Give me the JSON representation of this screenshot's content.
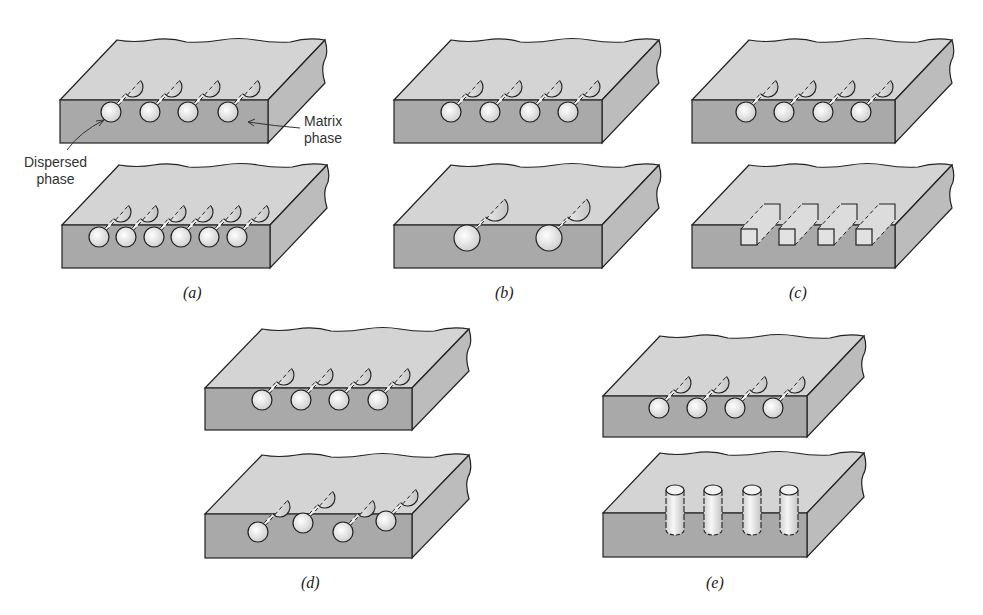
{
  "figure": {
    "panels": [
      {
        "id": "a",
        "label": "(a)",
        "description": "Concentration",
        "top": {
          "fibers": 4,
          "shape": "round"
        },
        "bottom": {
          "fibers": 6,
          "shape": "round"
        }
      },
      {
        "id": "b",
        "label": "(b)",
        "description": "Size",
        "top": {
          "fibers": 4,
          "shape": "round"
        },
        "bottom": {
          "fibers": 2,
          "shape": "round-large"
        }
      },
      {
        "id": "c",
        "label": "(c)",
        "description": "Shape",
        "top": {
          "fibers": 4,
          "shape": "round"
        },
        "bottom": {
          "fibers": 4,
          "shape": "square"
        }
      },
      {
        "id": "d",
        "label": "(d)",
        "description": "Distribution",
        "top": {
          "fibers": 4,
          "shape": "round"
        },
        "bottom": {
          "fibers": 4,
          "shape": "round-staggered"
        }
      },
      {
        "id": "e",
        "label": "(e)",
        "description": "Orientation",
        "top": {
          "fibers": 4,
          "shape": "round"
        },
        "bottom": {
          "fibers": 4,
          "shape": "vertical"
        }
      }
    ],
    "annotations": {
      "dispersed": [
        "Dispersed",
        "phase"
      ],
      "matrix": [
        "Matrix",
        "phase"
      ]
    },
    "colors": {
      "front_face": "#a9a9a9",
      "top_face": "#d4d4d4",
      "side_face": "#bcbcbc",
      "fiber": "#ececec",
      "outline": "#222222"
    }
  }
}
